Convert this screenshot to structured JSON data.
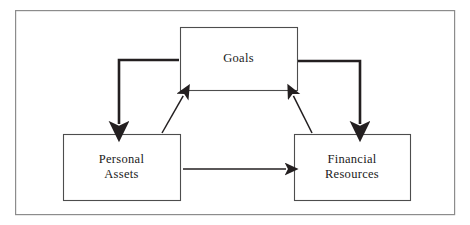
{
  "diagram": {
    "frame": {
      "name": "outer-border",
      "x": 15,
      "y": 10,
      "width": 440,
      "height": 205,
      "stroke": "#8c8c8c",
      "stroke_width": 1.2,
      "fill": "#ffffff"
    },
    "nodes": [
      {
        "id": "goals",
        "label": "Goals",
        "x": 180,
        "y": 27,
        "width": 117,
        "height": 63,
        "stroke": "#4d4d4d",
        "fill": "#ffffff"
      },
      {
        "id": "personal-assets",
        "label": "Personal\nAssets",
        "x": 63,
        "y": 134,
        "width": 117,
        "height": 66,
        "stroke": "#4d4d4d",
        "fill": "#ffffff"
      },
      {
        "id": "financial-resources",
        "label": "Financial\nResources",
        "x": 294,
        "y": 134,
        "width": 116,
        "height": 66,
        "stroke": "#4d4d4d",
        "fill": "#ffffff"
      }
    ],
    "edges": [
      {
        "id": "goals-to-personal-assets",
        "from": "goals",
        "to": "personal-assets",
        "style": "elbow",
        "weight": "thick",
        "color": "#231f20",
        "points": "179,60 119,60 119,130"
      },
      {
        "id": "goals-to-financial-resources",
        "from": "goals",
        "to": "financial-resources",
        "style": "elbow",
        "weight": "thick",
        "color": "#231f20",
        "points": "298,61 360,61 360,130"
      },
      {
        "id": "personal-assets-to-goals",
        "from": "personal-assets",
        "to": "goals",
        "style": "diagonal",
        "weight": "thin",
        "color": "#231f20",
        "points": "163,132 185,93"
      },
      {
        "id": "financial-resources-to-goals",
        "from": "financial-resources",
        "to": "goals",
        "style": "diagonal",
        "weight": "thin",
        "color": "#231f20",
        "points": "311,132 292,93"
      },
      {
        "id": "personal-assets-to-financial-resources",
        "from": "personal-assets",
        "to": "financial-resources",
        "style": "straight",
        "weight": "thin",
        "color": "#231f20",
        "points": "183,169 290,169"
      }
    ],
    "colors": {
      "background": "#ffffff",
      "border": "#8c8c8c",
      "box_stroke": "#4d4d4d",
      "arrow": "#231f20",
      "text": "#1a1a1a"
    }
  }
}
